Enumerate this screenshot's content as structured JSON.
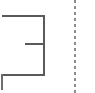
{
  "canvas": {
    "width": 95,
    "height": 93,
    "background": "#ffffff"
  },
  "drawing": {
    "title": "floor-plan-fragment",
    "type": "line-drawing",
    "stroke_color": "#5a5a5a",
    "stroke_color_light": "#6e6e6e",
    "stroke_width": 2,
    "guide_color": "#8c8c8c",
    "guide_width": 2,
    "guide_dash": "3 3"
  },
  "segments": [
    {
      "name": "top-wall",
      "orientation": "horizontal",
      "x1": 2,
      "y1": 16,
      "x2": 44,
      "y2": 16,
      "color": "#5a5a5a",
      "width": 2
    },
    {
      "name": "right-wall",
      "orientation": "vertical",
      "x1": 44,
      "y1": 15,
      "x2": 44,
      "y2": 76,
      "color": "#5a5a5a",
      "width": 2
    },
    {
      "name": "bottom-wall",
      "orientation": "horizontal",
      "x1": 2,
      "y1": 75,
      "x2": 44,
      "y2": 75,
      "color": "#5a5a5a",
      "width": 2
    },
    {
      "name": "interior-wall",
      "orientation": "horizontal",
      "x1": 25,
      "y1": 44,
      "x2": 44,
      "y2": 44,
      "color": "#5a5a5a",
      "width": 2
    },
    {
      "name": "left-stub-wall",
      "orientation": "vertical",
      "x1": 2,
      "y1": 74,
      "x2": 2,
      "y2": 90,
      "color": "#6e6e6e",
      "width": 2
    }
  ],
  "guides": [
    {
      "name": "vertical-guide-line",
      "orientation": "vertical",
      "x1": 75,
      "y1": 0,
      "x2": 75,
      "y2": 93,
      "color": "#8c8c8c",
      "width": 2,
      "dash": "3 3"
    }
  ]
}
